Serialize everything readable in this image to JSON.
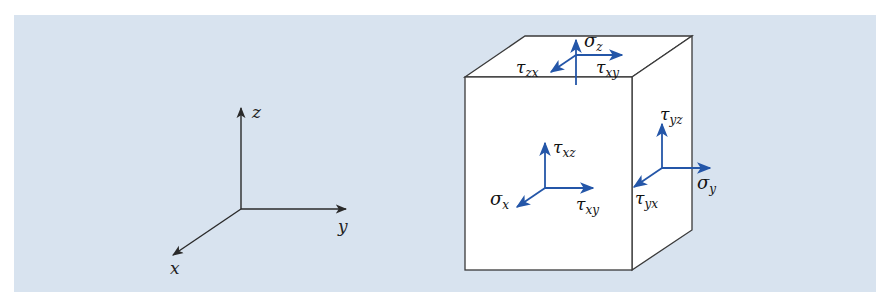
{
  "colors": {
    "panel_bg": "#d8e3ef",
    "axis_stroke": "#2a2a2a",
    "cube_stroke": "#3a3a3a",
    "cube_fill": "#ffffff",
    "stress_arrow": "#2456a8"
  },
  "axes": {
    "z_label": "z",
    "y_label": "y",
    "x_label": "x"
  },
  "stress_labels": {
    "sigma_z": "σ",
    "sigma_z_sub": "z",
    "tau_zx": "τ",
    "tau_zx_sub": "zx",
    "tau_xy_top": "τ",
    "tau_xy_top_sub": "xy",
    "tau_xz": "τ",
    "tau_xz_sub": "xz",
    "sigma_x": "σ",
    "sigma_x_sub": "x",
    "tau_xy_front": "τ",
    "tau_xy_front_sub": "xy",
    "tau_yz": "τ",
    "tau_yz_sub": "yz",
    "sigma_y": "σ",
    "sigma_y_sub": "y",
    "tau_yx": "τ",
    "tau_yx_sub": "yx"
  }
}
